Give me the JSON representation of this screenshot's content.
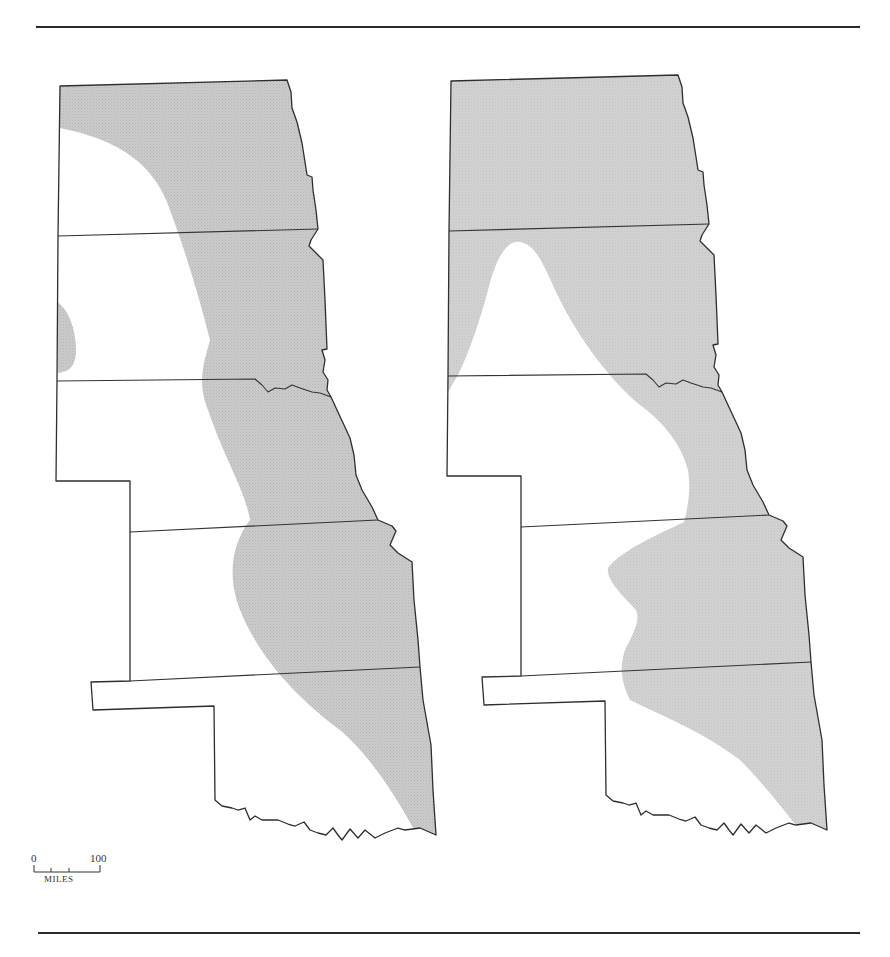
{
  "figure": {
    "panels": [
      {
        "id": "left",
        "region": "Great Plains (North Dakota, South Dakota, Nebraska, Kansas, Oklahoma)",
        "shade_color": "#c9c9c9"
      },
      {
        "id": "right",
        "region": "Great Plains (North Dakota, South Dakota, Nebraska, Kansas, Oklahoma)",
        "shade_color": "#cfcfcf"
      }
    ],
    "scale_bar": {
      "start_label": "0",
      "end_label": "100",
      "unit_label": "MILES"
    }
  },
  "colors": {
    "rule": "#2b2b2b",
    "outline": "#2e2e2e",
    "shade": "#c9c9c9",
    "background": "#ffffff"
  }
}
